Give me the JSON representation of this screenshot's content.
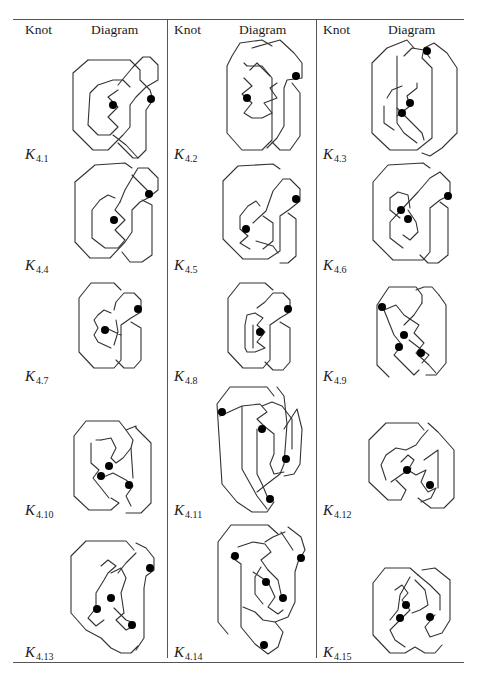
{
  "table": {
    "columns": [
      {
        "knot_header": "Knot",
        "diagram_header": "Diagram"
      },
      {
        "knot_header": "Knot",
        "diagram_header": "Diagram"
      },
      {
        "knot_header": "Knot",
        "diagram_header": "Diagram"
      }
    ],
    "knots": [
      {
        "id": "K4.1",
        "base": "K",
        "sub": "4.1",
        "virtual_crossings": 2
      },
      {
        "id": "K4.2",
        "base": "K",
        "sub": "4.2",
        "virtual_crossings": 2
      },
      {
        "id": "K4.3",
        "base": "K",
        "sub": "4.3",
        "virtual_crossings": 3
      },
      {
        "id": "K4.4",
        "base": "K",
        "sub": "4.4",
        "virtual_crossings": 2
      },
      {
        "id": "K4.5",
        "base": "K",
        "sub": "4.5",
        "virtual_crossings": 2
      },
      {
        "id": "K4.6",
        "base": "K",
        "sub": "4.6",
        "virtual_crossings": 3
      },
      {
        "id": "K4.7",
        "base": "K",
        "sub": "4.7",
        "virtual_crossings": 2
      },
      {
        "id": "K4.8",
        "base": "K",
        "sub": "4.8",
        "virtual_crossings": 2
      },
      {
        "id": "K4.9",
        "base": "K",
        "sub": "4.9",
        "virtual_crossings": 4
      },
      {
        "id": "K4.10",
        "base": "K",
        "sub": "4.10",
        "virtual_crossings": 3
      },
      {
        "id": "K4.11",
        "base": "K",
        "sub": "4.11",
        "virtual_crossings": 4
      },
      {
        "id": "K4.12",
        "base": "K",
        "sub": "4.12",
        "virtual_crossings": 2
      },
      {
        "id": "K4.13",
        "base": "K",
        "sub": "4.13",
        "virtual_crossings": 4
      },
      {
        "id": "K4.14",
        "base": "K",
        "sub": "4.14",
        "virtual_crossings": 5
      },
      {
        "id": "K4.15",
        "base": "K",
        "sub": "4.15",
        "virtual_crossings": 3
      }
    ]
  },
  "colors": {
    "line": "#333333",
    "rule": "#555555",
    "background": "#ffffff"
  }
}
